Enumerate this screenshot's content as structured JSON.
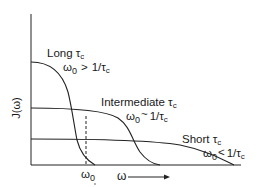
{
  "figure": {
    "y_axis_label": "J(ω)",
    "x_axis_label": "ω",
    "x_marker_label": "ω0",
    "curves": [
      {
        "name": "long",
        "title": "Long τc",
        "title_main": "Long τ",
        "title_sub": "c",
        "condition": "ω0 > 1/τc",
        "cond_w": "ω",
        "cond_w_sub": "0",
        "cond_op": ">",
        "cond_rhs": "1/τ",
        "cond_rhs_sub": "c"
      },
      {
        "name": "intermediate",
        "title": "Intermediate τc",
        "title_main": "Intermediate τ",
        "title_sub": "c",
        "condition": "ω0 ~ 1/τc",
        "cond_w": "ω",
        "cond_w_sub": "0",
        "cond_op": "~",
        "cond_rhs": "1/τ",
        "cond_rhs_sub": "c"
      },
      {
        "name": "short",
        "title": "Short τc",
        "title_main": "Short τ",
        "title_sub": "c",
        "condition": "ω0 < 1/τc",
        "cond_w": "ω",
        "cond_w_sub": "0",
        "cond_op": "<",
        "cond_rhs": "1/τ",
        "cond_rhs_sub": "c"
      }
    ]
  }
}
